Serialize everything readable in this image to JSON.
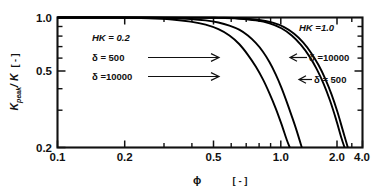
{
  "chart_data": {
    "type": "line",
    "title": "",
    "xlabel": "ϕ",
    "xunit": "[ - ]",
    "ylabel_main": "K",
    "ylabel_sub": "peak",
    "ylabel_den": "/ K",
    "yunit": "[ - ]",
    "xscale": "log",
    "yscale": "log",
    "xlim": [
      0.1,
      4.0
    ],
    "ylim": [
      0.2,
      1.0
    ],
    "grid": false,
    "legend_position": "in-plot annotations",
    "xticks": [
      {
        "value": 0.1,
        "label": "0.1",
        "major": true
      },
      {
        "value": 0.2,
        "label": "0.2",
        "major": true
      },
      {
        "value": 0.3,
        "label": "",
        "major": false
      },
      {
        "value": 0.4,
        "label": "",
        "major": false
      },
      {
        "value": 0.5,
        "label": "0.5",
        "major": true
      },
      {
        "value": 0.6,
        "label": "",
        "major": false
      },
      {
        "value": 0.7,
        "label": "",
        "major": false
      },
      {
        "value": 0.8,
        "label": "",
        "major": false
      },
      {
        "value": 0.9,
        "label": "",
        "major": false
      },
      {
        "value": 1.0,
        "label": "1.0",
        "major": true
      },
      {
        "value": 2.0,
        "label": "2.0",
        "major": true
      },
      {
        "value": 3.0,
        "label": "",
        "major": false
      },
      {
        "value": 4.0,
        "label": "4.0",
        "major": true
      }
    ],
    "yticks": [
      {
        "value": 1.0,
        "label": "1.0",
        "major": true
      },
      {
        "value": 0.9,
        "label": "",
        "major": false
      },
      {
        "value": 0.8,
        "label": "",
        "major": false
      },
      {
        "value": 0.7,
        "label": "",
        "major": false
      },
      {
        "value": 0.6,
        "label": "",
        "major": false
      },
      {
        "value": 0.5,
        "label": "0.5",
        "major": true
      },
      {
        "value": 0.4,
        "label": "",
        "major": false
      },
      {
        "value": 0.3,
        "label": "",
        "major": false
      },
      {
        "value": 0.2,
        "label": "0.2",
        "major": true
      }
    ],
    "series": [
      {
        "name": "HK = 0.2, δ = 10000",
        "hk": "0.2",
        "delta": "10000",
        "points": [
          [
            0.1,
            1.0
          ],
          [
            0.2,
            0.998
          ],
          [
            0.3,
            0.99
          ],
          [
            0.4,
            0.975
          ],
          [
            0.5,
            0.95
          ],
          [
            0.6,
            0.915
          ],
          [
            0.7,
            0.865
          ],
          [
            0.8,
            0.8
          ],
          [
            0.9,
            0.72
          ],
          [
            1.0,
            0.63
          ],
          [
            1.1,
            0.545
          ],
          [
            1.2,
            0.465
          ],
          [
            1.3,
            0.39
          ],
          [
            1.4,
            0.325
          ],
          [
            1.5,
            0.268
          ],
          [
            1.6,
            0.22
          ],
          [
            1.66,
            0.2
          ]
        ]
      },
      {
        "name": "HK = 0.2, δ = 500",
        "hk": "0.2",
        "delta": "500",
        "points": [
          [
            0.1,
            1.0
          ],
          [
            0.3,
            0.998
          ],
          [
            0.4,
            0.992
          ],
          [
            0.5,
            0.982
          ],
          [
            0.6,
            0.965
          ],
          [
            0.7,
            0.94
          ],
          [
            0.8,
            0.905
          ],
          [
            0.9,
            0.86
          ],
          [
            1.0,
            0.8
          ],
          [
            1.1,
            0.73
          ],
          [
            1.2,
            0.655
          ],
          [
            1.3,
            0.575
          ],
          [
            1.4,
            0.495
          ],
          [
            1.5,
            0.42
          ],
          [
            1.6,
            0.352
          ],
          [
            1.7,
            0.295
          ],
          [
            1.8,
            0.248
          ],
          [
            1.92,
            0.2
          ]
        ]
      },
      {
        "name": "HK = 1.0, δ = 10000",
        "hk": "1.0",
        "delta": "10000",
        "points": [
          [
            0.1,
            1.0
          ],
          [
            0.5,
            0.999
          ],
          [
            0.7,
            0.995
          ],
          [
            0.9,
            0.985
          ],
          [
            1.1,
            0.965
          ],
          [
            1.3,
            0.93
          ],
          [
            1.5,
            0.875
          ],
          [
            1.7,
            0.8
          ],
          [
            1.9,
            0.712
          ],
          [
            2.1,
            0.62
          ],
          [
            2.3,
            0.528
          ],
          [
            2.5,
            0.44
          ],
          [
            2.7,
            0.358
          ],
          [
            2.9,
            0.285
          ],
          [
            3.1,
            0.225
          ],
          [
            3.22,
            0.2
          ]
        ]
      },
      {
        "name": "HK = 1.0, δ = 500",
        "hk": "1.0",
        "delta": "500",
        "points": [
          [
            0.1,
            1.0
          ],
          [
            0.5,
            0.999
          ],
          [
            0.75,
            0.996
          ],
          [
            0.95,
            0.988
          ],
          [
            1.15,
            0.97
          ],
          [
            1.35,
            0.938
          ],
          [
            1.55,
            0.888
          ],
          [
            1.75,
            0.818
          ],
          [
            1.95,
            0.735
          ],
          [
            2.15,
            0.645
          ],
          [
            2.35,
            0.555
          ],
          [
            2.55,
            0.468
          ],
          [
            2.75,
            0.386
          ],
          [
            2.95,
            0.312
          ],
          [
            3.15,
            0.248
          ],
          [
            3.35,
            0.2
          ]
        ]
      }
    ],
    "annotations": [
      {
        "id": "hk-left",
        "text": "HK = 0.2",
        "italic_part": "HK"
      },
      {
        "id": "delta-left-500",
        "text": "δ =    500"
      },
      {
        "id": "delta-left-10000",
        "text": "δ =10000"
      },
      {
        "id": "hk-right",
        "text": "HK =1.0",
        "italic_part": "HK"
      },
      {
        "id": "delta-right-10000",
        "text": "δ =10000"
      },
      {
        "id": "delta-right-500",
        "text": "δ = 500"
      }
    ]
  }
}
